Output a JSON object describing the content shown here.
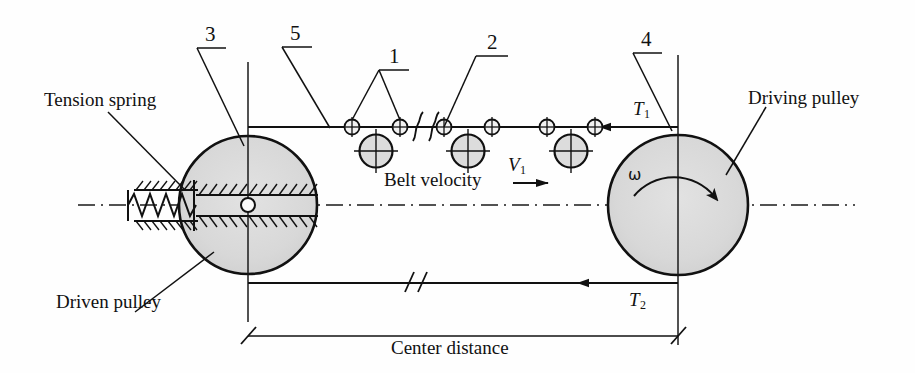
{
  "figure": {
    "background_color": "#fefefe",
    "line_color": "#1a1a1a",
    "pulley_fill": "#d9d9d9"
  },
  "labels": {
    "tension_spring": "Tension spring",
    "driven_pulley": "Driven pulley",
    "driving_pulley": "Driving pulley",
    "belt_velocity": "Belt velocity",
    "center_distance": "Center distance",
    "velocity_symbol": "V",
    "velocity_subscript": "1",
    "tension_top_symbol": "T",
    "tension_top_subscript": "1",
    "tension_bottom_symbol": "T",
    "tension_bottom_subscript": "2",
    "omega": "ω"
  },
  "callouts": [
    {
      "id": "1",
      "label": "1"
    },
    {
      "id": "2",
      "label": "2"
    },
    {
      "id": "3",
      "label": "3"
    },
    {
      "id": "4",
      "label": "4"
    },
    {
      "id": "5",
      "label": "5"
    }
  ],
  "geometry": {
    "left_pulley": {
      "cx": 248,
      "cy": 205,
      "r": 69
    },
    "right_pulley": {
      "cx": 678,
      "cy": 205,
      "r": 70
    },
    "belt_top_y": 127,
    "belt_bottom_y": 283,
    "centerline_y": 205,
    "center_distance_y": 336,
    "chain_pin_radius": 7,
    "chain_roller_radius": 16
  }
}
